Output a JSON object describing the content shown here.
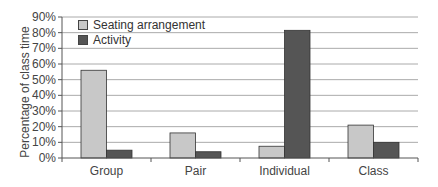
{
  "chart_data": {
    "type": "bar",
    "title": "",
    "xlabel": "",
    "ylabel": "Percentage of class time",
    "ylim": [
      0,
      90
    ],
    "yticks": [
      "0%",
      "10%",
      "20%",
      "30%",
      "40%",
      "50%",
      "60%",
      "70%",
      "80%",
      "90%"
    ],
    "grid": true,
    "legend_position": "upper-left",
    "categories": [
      "Group",
      "Pair",
      "Individual",
      "Class"
    ],
    "series": [
      {
        "name": "Seating arrangement",
        "color": "#c8c8c8",
        "values": [
          56,
          16,
          7.5,
          21
        ]
      },
      {
        "name": "Activity",
        "color": "#555555",
        "values": [
          5,
          4,
          81.5,
          10
        ]
      }
    ]
  },
  "axis": {
    "ylabel": "Percentage of class time"
  },
  "legend": {
    "items": [
      {
        "label": "Seating arrangement",
        "color": "#c8c8c8"
      },
      {
        "label": "Activity",
        "color": "#555555"
      }
    ]
  }
}
